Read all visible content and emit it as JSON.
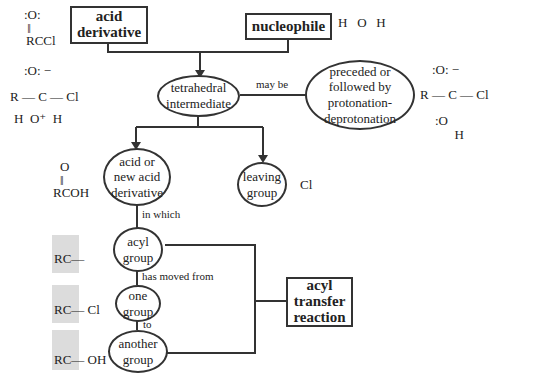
{
  "boxes": {
    "acid_derivative": "acid\nderivative",
    "nucleophile": "nucleophile",
    "acyl_transfer": "acyl\ntransfer\nreaction"
  },
  "nodes": {
    "tetrahedral": "tetrahedral\nintermediate",
    "protonation": "preceded or\nfollowed by\nprotonation-\ndeprotonation",
    "acid_new": "acid or\nnew acid\nderivative",
    "leaving": "leaving\ngroup",
    "acyl_group": "acyl\ngroup",
    "one_group": "one\ngroup",
    "another_group": "another\ngroup"
  },
  "links": {
    "may_be": "may be",
    "in_which": "in which",
    "has_moved_from": "has moved from",
    "to": "to"
  },
  "structures": {
    "acyl_chloride": "RCCl",
    "water": "H   O   H",
    "tetra_left": "R — C — Cl",
    "tetra_right": "R — C — Cl",
    "carboxylic_acid": "RCOH",
    "chloride_ion": "Cl",
    "acyl_fragment": "RC—",
    "acyl_cl": "RC— Cl",
    "acyl_oh": "RC— OH"
  },
  "colors": {
    "line": "#333333",
    "shade": "#dcdcdc"
  }
}
